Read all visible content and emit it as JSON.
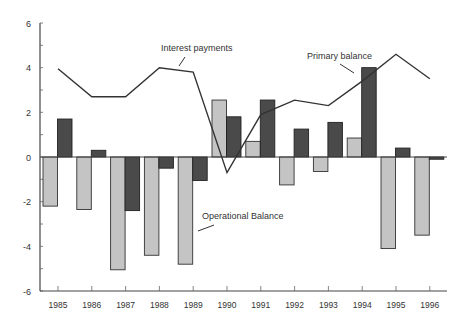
{
  "chart_data": {
    "type": "bar",
    "title": "",
    "xlabel": "",
    "ylabel": "",
    "ylim": [
      -6,
      6
    ],
    "yticks": [
      -6,
      -4,
      -2,
      0,
      2,
      4,
      6
    ],
    "grid": false,
    "legend": "inline annotations",
    "categories": [
      "1985",
      "1986",
      "1987",
      "1988",
      "1989",
      "1990",
      "1991",
      "1992",
      "1993",
      "1994",
      "1995",
      "1996"
    ],
    "series": [
      {
        "name": "Operational Balance",
        "type": "bar",
        "color": "#c4c4c4",
        "values": [
          -2.2,
          -2.35,
          -5.05,
          -4.4,
          -4.8,
          2.55,
          0.7,
          -1.25,
          -0.65,
          0.85,
          -4.1,
          -3.5
        ]
      },
      {
        "name": "Primary balance",
        "type": "bar",
        "color": "#4a4a4a",
        "values": [
          1.7,
          0.3,
          -2.4,
          -0.5,
          -1.05,
          1.8,
          2.55,
          1.25,
          1.55,
          4.0,
          0.4,
          -0.1
        ]
      },
      {
        "name": "Interest payments",
        "type": "line",
        "color": "#333333",
        "values": [
          3.95,
          2.7,
          2.7,
          4.0,
          3.8,
          -0.7,
          1.9,
          2.55,
          2.3,
          3.4,
          4.6,
          3.5
        ]
      }
    ],
    "annotations": [
      {
        "text": "Interest payments",
        "series": "Interest payments"
      },
      {
        "text": "Primary balance",
        "series": "Primary balance"
      },
      {
        "text": "Operational Balance",
        "series": "Operational Balance"
      }
    ]
  },
  "labels": {
    "interest": "Interest payments",
    "primary": "Primary balance",
    "operational": "Operational Balance"
  }
}
